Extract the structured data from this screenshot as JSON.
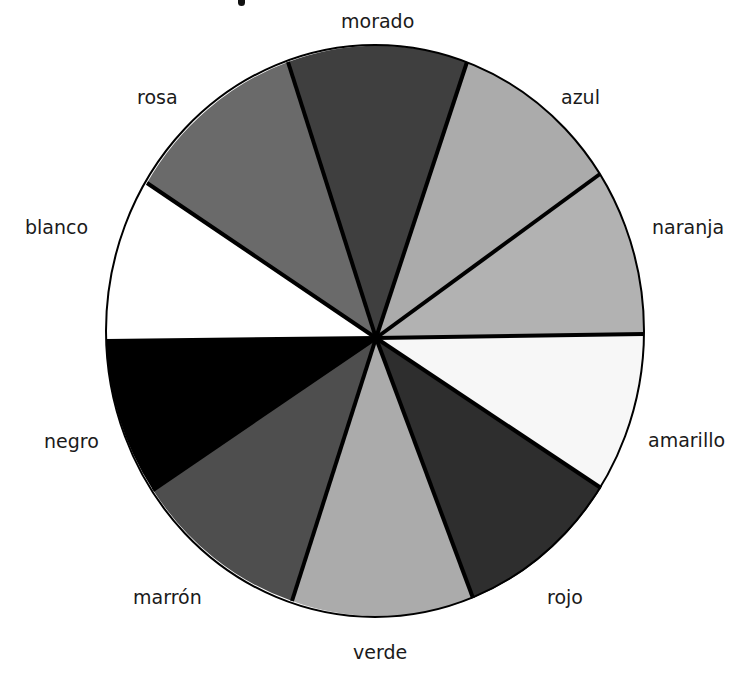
{
  "diagram": {
    "type": "color-wheel",
    "center": [
      375,
      331
    ],
    "hub": [
      376,
      338
    ],
    "radius_x": 269,
    "radius_y": 286,
    "outline_color": "#000000",
    "segments": [
      {
        "name": "morado",
        "color": "#3f3f3f",
        "from": [
          288,
          62
        ],
        "to": [
          467,
          62
        ]
      },
      {
        "name": "azul",
        "color": "#ababab",
        "from": [
          467,
          62
        ],
        "to": [
          600,
          174
        ]
      },
      {
        "name": "naranja",
        "color": "#b2b2b2",
        "from": [
          600,
          174
        ],
        "to": [
          644,
          334
        ]
      },
      {
        "name": "amarillo",
        "color": "#f7f7f7",
        "from": [
          644,
          334
        ],
        "to": [
          601,
          488
        ]
      },
      {
        "name": "rojo",
        "color": "#2e2e2e",
        "from": [
          601,
          488
        ],
        "to": [
          473,
          598
        ]
      },
      {
        "name": "verde",
        "color": "#ababab",
        "from": [
          473,
          598
        ],
        "to": [
          292,
          601
        ]
      },
      {
        "name": "marrón",
        "color": "#4e4e4e",
        "from": [
          292,
          601
        ],
        "to": [
          153,
          490
        ]
      },
      {
        "name": "negro",
        "color": "#000000",
        "from": [
          153,
          490
        ],
        "to": [
          106,
          341
        ]
      },
      {
        "name": "blanco",
        "color": "#ffffff",
        "from": [
          106,
          341
        ],
        "to": [
          147,
          183
        ]
      },
      {
        "name": "rosa",
        "color": "#6a6a6a",
        "from": [
          147,
          183
        ],
        "to": [
          288,
          62
        ]
      }
    ]
  },
  "labels": {
    "morado": {
      "text": "morado",
      "x": 341,
      "y": 12
    },
    "azul": {
      "text": "azul",
      "x": 561,
      "y": 88
    },
    "naranja": {
      "text": "naranja",
      "x": 652,
      "y": 218
    },
    "amarillo": {
      "text": "amarillo",
      "x": 648,
      "y": 431
    },
    "rojo": {
      "text": "rojo",
      "x": 547,
      "y": 588
    },
    "verde": {
      "text": "verde",
      "x": 353,
      "y": 643
    },
    "marron": {
      "text": "marrón",
      "x": 133,
      "y": 588
    },
    "negro": {
      "text": "negro",
      "x": 44,
      "y": 432
    },
    "blanco": {
      "text": "blanco",
      "x": 25,
      "y": 218
    },
    "rosa": {
      "text": "rosa",
      "x": 137,
      "y": 88
    }
  }
}
